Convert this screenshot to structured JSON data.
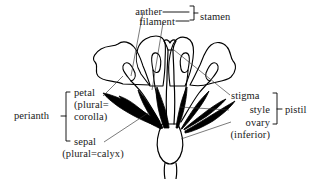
{
  "figure": {
    "background_color": "#ffffff",
    "stroke_color": "#000000",
    "text_color": "#1a1a1a"
  },
  "labels": {
    "anther": "anther",
    "filament": "filament",
    "stamen": "stamen",
    "perianth": "perianth",
    "petal": "petal",
    "petal_plural_1": "(plural=",
    "petal_plural_2": "corolla)",
    "sepal": "sepal",
    "sepal_plural": "(plural=calyx)",
    "stigma": "stigma",
    "style": "style",
    "ovary": "ovary",
    "ovary_note": "(inferior)",
    "pistil": "pistil"
  },
  "groups": {
    "stamen_bracket": [
      "anther",
      "filament"
    ],
    "perianth_bracket": [
      "petal",
      "sepal"
    ],
    "pistil_bracket": [
      "stigma",
      "style",
      "ovary"
    ]
  },
  "parts": [
    "petal",
    "sepal",
    "anther",
    "filament",
    "stigma",
    "style",
    "ovary"
  ]
}
